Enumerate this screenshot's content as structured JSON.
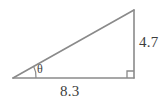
{
  "figure": {
    "type": "right-triangle-diagram",
    "stroke_color": "#8a8a8a",
    "label_color": "#3d3d3d",
    "background_color": "#ffffff",
    "labels": {
      "vertical_leg": "4.7",
      "horizontal_leg": "8.3",
      "angle": "θ"
    },
    "icons": {
      "right_angle": "right-angle-marker",
      "angle_arc": "angle-arc"
    },
    "geometry": {
      "left_vertex_x": 13,
      "left_vertex_y": 78,
      "right_vertex_x": 134,
      "right_vertex_y": 78,
      "apex_x": 134,
      "apex_y": 10
    }
  }
}
